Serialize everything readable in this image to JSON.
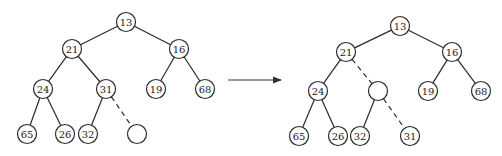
{
  "diagram": {
    "type": "binary-heap-percolate-up",
    "node_radius": 9.5,
    "colors": {
      "stroke": "#2a2a2a",
      "fill": "#ffffff",
      "text": "#222222"
    },
    "before": {
      "nodes": [
        {
          "id": "n13",
          "label": "13",
          "x": 126,
          "y": 22
        },
        {
          "id": "n21",
          "label": "21",
          "x": 72,
          "y": 49
        },
        {
          "id": "n16",
          "label": "16",
          "x": 179,
          "y": 49
        },
        {
          "id": "n24",
          "label": "24",
          "x": 43,
          "y": 89
        },
        {
          "id": "n31",
          "label": "31",
          "x": 106,
          "y": 89
        },
        {
          "id": "n19",
          "label": "19",
          "x": 156,
          "y": 89
        },
        {
          "id": "n68",
          "label": "68",
          "x": 205,
          "y": 89
        },
        {
          "id": "n65",
          "label": "65",
          "x": 27,
          "y": 134
        },
        {
          "id": "n26",
          "label": "26",
          "x": 65,
          "y": 134
        },
        {
          "id": "n32",
          "label": "32",
          "x": 88,
          "y": 134
        },
        {
          "id": "hole",
          "label": "",
          "x": 137,
          "y": 134
        }
      ],
      "edges": [
        {
          "from": "n13",
          "to": "n21",
          "dashed": false
        },
        {
          "from": "n13",
          "to": "n16",
          "dashed": false
        },
        {
          "from": "n21",
          "to": "n24",
          "dashed": false
        },
        {
          "from": "n21",
          "to": "n31",
          "dashed": false
        },
        {
          "from": "n16",
          "to": "n19",
          "dashed": false
        },
        {
          "from": "n16",
          "to": "n68",
          "dashed": false
        },
        {
          "from": "n24",
          "to": "n65",
          "dashed": false
        },
        {
          "from": "n24",
          "to": "n26",
          "dashed": false
        },
        {
          "from": "n31",
          "to": "n32",
          "dashed": false
        },
        {
          "from": "n31",
          "to": "hole",
          "dashed": true
        }
      ]
    },
    "arrow": {
      "x1": 228,
      "y1": 80,
      "x2": 281,
      "y2": 80
    },
    "after": {
      "nodes": [
        {
          "id": "m13",
          "label": "13",
          "x": 400,
          "y": 26
        },
        {
          "id": "m21",
          "label": "21",
          "x": 346,
          "y": 52
        },
        {
          "id": "m16",
          "label": "16",
          "x": 452,
          "y": 52
        },
        {
          "id": "m24",
          "label": "24",
          "x": 318,
          "y": 91
        },
        {
          "id": "mhole",
          "label": "",
          "x": 378,
          "y": 91
        },
        {
          "id": "m19",
          "label": "19",
          "x": 428,
          "y": 91
        },
        {
          "id": "m68",
          "label": "68",
          "x": 481,
          "y": 91
        },
        {
          "id": "m65",
          "label": "65",
          "x": 299,
          "y": 136
        },
        {
          "id": "m26",
          "label": "26",
          "x": 338,
          "y": 136
        },
        {
          "id": "m32",
          "label": "32",
          "x": 360,
          "y": 136
        },
        {
          "id": "m31",
          "label": "31",
          "x": 410,
          "y": 136
        }
      ],
      "edges": [
        {
          "from": "m13",
          "to": "m21",
          "dashed": false
        },
        {
          "from": "m13",
          "to": "m16",
          "dashed": false
        },
        {
          "from": "m21",
          "to": "m24",
          "dashed": false
        },
        {
          "from": "m21",
          "to": "mhole",
          "dashed": true
        },
        {
          "from": "m16",
          "to": "m19",
          "dashed": false
        },
        {
          "from": "m16",
          "to": "m68",
          "dashed": false
        },
        {
          "from": "m24",
          "to": "m65",
          "dashed": false
        },
        {
          "from": "m24",
          "to": "m26",
          "dashed": false
        },
        {
          "from": "mhole",
          "to": "m32",
          "dashed": false
        },
        {
          "from": "mhole",
          "to": "m31",
          "dashed": true
        }
      ]
    }
  }
}
